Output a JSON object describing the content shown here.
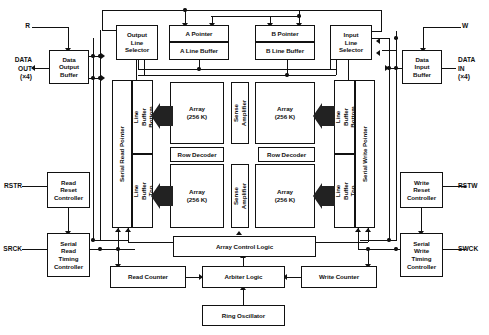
{
  "diagram": {
    "colors": {
      "line": "#111111",
      "background": "#ffffff",
      "fill": "#ffffff"
    }
  },
  "pins": {
    "r": "R",
    "w": "W",
    "data_out": "DATA\nOUT\n(×4)",
    "data_in": "DATA\nIN\n(×4)",
    "rstr": "RSTR",
    "rstw": "RSTW",
    "srck": "SRCK",
    "swck": "SWCK"
  },
  "blocks": {
    "data_output_buffer": "Data\nOutput\nBuffer",
    "data_input_buffer": "Data\nInput\nBuffer",
    "output_line_selector": "Output\nLine\nSelector",
    "input_line_selector": "Input\nLine\nSelector",
    "a_pointer": "A Pointer",
    "a_line_buffer": "A Line Buffer",
    "b_pointer": "B Pointer",
    "b_line_buffer": "B Line Buffer",
    "serial_read_pointer": "Serial Read Pointer",
    "serial_write_pointer": "Serial Write Pointer",
    "read_line_buffer_bottom": "Read Line Buffer\nBottom Block",
    "read_line_buffer_top": "Read Line Buffer\nTop Block",
    "write_line_buffer_bottom": "Write Line Buffer\nBottom Block",
    "write_line_buffer_top": "Write Line Buffer\nTop Block",
    "array_tl": "Array\n(256 K)",
    "array_tr": "Array\n(256 K)",
    "array_bl": "Array\n(256 K)",
    "array_br": "Array\n(256 K)",
    "sense_amplifier_top": "Sense\nAmplifier",
    "sense_amplifier_bottom": "Sense\nAmplifier",
    "row_decoder_left": "Row Decoder",
    "row_decoder_right": "Row Decoder",
    "read_reset_controller": "Read\nReset\nController",
    "write_reset_controller": "Write\nReset\nController",
    "serial_read_timing_controller": "Serial\nRead\nTiming\nController",
    "serial_write_timing_controller": "Serial\nWrite\nTiming\nController",
    "array_control_logic": "Array Control Logic",
    "read_counter": "Read Counter",
    "arbiter_logic": "Arbiter Logic",
    "write_counter": "Write Counter",
    "ring_oscillator": "Ring Oscillator"
  }
}
